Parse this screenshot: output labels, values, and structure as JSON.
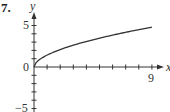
{
  "problem_number": "7.",
  "chart_data": {
    "type": "line",
    "title": "",
    "xlabel": "x",
    "ylabel": "y",
    "xlim": [
      0,
      9
    ],
    "ylim": [
      -5,
      5
    ],
    "x_tick_labels": [
      "9"
    ],
    "y_tick_labels": [
      "5",
      "0",
      "-5"
    ],
    "x_ticks": [
      1,
      2,
      3,
      4,
      5,
      6,
      7,
      8,
      9
    ],
    "y_ticks": [
      -5,
      -4,
      -3,
      -2,
      -1,
      1,
      2,
      3,
      4,
      5
    ],
    "grid": false,
    "series": [
      {
        "name": "curve",
        "x": [
          0,
          1,
          2,
          3,
          4,
          5,
          6,
          7,
          8,
          9
        ],
        "values": [
          0,
          1.6,
          2.3,
          2.8,
          3.2,
          3.6,
          3.9,
          4.2,
          4.5,
          4.8
        ]
      }
    ]
  },
  "labels": {
    "x_axis": "x",
    "y_axis": "y",
    "tick_9": "9",
    "tick_5": "5",
    "tick_0": "0",
    "tick_neg5": "−5"
  }
}
